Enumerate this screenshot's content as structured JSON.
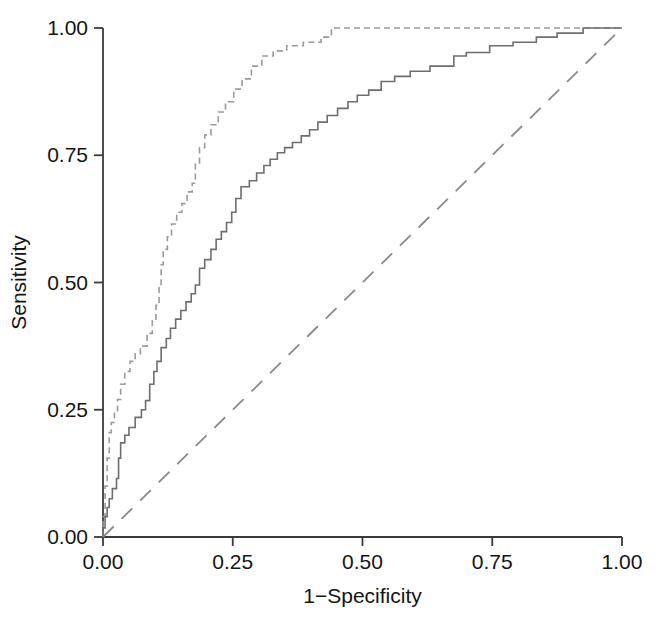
{
  "chart_data": {
    "type": "line",
    "title": "",
    "subtitle": "",
    "xlabel": "1−Specificity",
    "ylabel": "Sensitivity",
    "xlim": [
      0,
      1
    ],
    "ylim": [
      0,
      1
    ],
    "grid": false,
    "legend": "none",
    "legend_entries": [],
    "annotations": [],
    "xticks": [
      0,
      0.25,
      0.5,
      0.75,
      1
    ],
    "yticks": [
      0,
      0.25,
      0.5,
      0.75,
      1
    ],
    "xticklabels": [
      "0.00",
      "0.25",
      "0.50",
      "0.75",
      "1.00"
    ],
    "yticklabels": [
      "0.00",
      "0.25",
      "0.50",
      "0.75",
      "1.00"
    ],
    "axis_color": "#3a3a3a",
    "text_color": "#141414",
    "series": [
      {
        "name": "roc-curve-dashed",
        "style": "dashed",
        "color": "#9a9a9a",
        "linewidth": 1.6,
        "drawstyle": "steps-post",
        "points": [
          [
            0.0,
            0.0
          ],
          [
            0.0,
            0.04
          ],
          [
            0.004,
            0.04
          ],
          [
            0.004,
            0.1
          ],
          [
            0.008,
            0.1
          ],
          [
            0.008,
            0.155
          ],
          [
            0.012,
            0.155
          ],
          [
            0.012,
            0.205
          ],
          [
            0.016,
            0.205
          ],
          [
            0.016,
            0.225
          ],
          [
            0.022,
            0.225
          ],
          [
            0.022,
            0.245
          ],
          [
            0.028,
            0.245
          ],
          [
            0.028,
            0.27
          ],
          [
            0.034,
            0.27
          ],
          [
            0.034,
            0.3
          ],
          [
            0.042,
            0.3
          ],
          [
            0.042,
            0.325
          ],
          [
            0.052,
            0.325
          ],
          [
            0.052,
            0.345
          ],
          [
            0.062,
            0.345
          ],
          [
            0.062,
            0.36
          ],
          [
            0.072,
            0.36
          ],
          [
            0.072,
            0.375
          ],
          [
            0.085,
            0.375
          ],
          [
            0.085,
            0.4
          ],
          [
            0.095,
            0.4
          ],
          [
            0.095,
            0.425
          ],
          [
            0.102,
            0.425
          ],
          [
            0.102,
            0.455
          ],
          [
            0.108,
            0.455
          ],
          [
            0.108,
            0.49
          ],
          [
            0.112,
            0.49
          ],
          [
            0.112,
            0.535
          ],
          [
            0.116,
            0.535
          ],
          [
            0.116,
            0.565
          ],
          [
            0.124,
            0.565
          ],
          [
            0.124,
            0.59
          ],
          [
            0.132,
            0.59
          ],
          [
            0.132,
            0.615
          ],
          [
            0.142,
            0.615
          ],
          [
            0.142,
            0.638
          ],
          [
            0.152,
            0.638
          ],
          [
            0.152,
            0.655
          ],
          [
            0.162,
            0.655
          ],
          [
            0.162,
            0.678
          ],
          [
            0.172,
            0.678
          ],
          [
            0.172,
            0.695
          ],
          [
            0.178,
            0.695
          ],
          [
            0.178,
            0.735
          ],
          [
            0.186,
            0.735
          ],
          [
            0.186,
            0.765
          ],
          [
            0.196,
            0.765
          ],
          [
            0.196,
            0.79
          ],
          [
            0.208,
            0.79
          ],
          [
            0.208,
            0.81
          ],
          [
            0.222,
            0.81
          ],
          [
            0.222,
            0.835
          ],
          [
            0.236,
            0.835
          ],
          [
            0.236,
            0.855
          ],
          [
            0.252,
            0.855
          ],
          [
            0.252,
            0.88
          ],
          [
            0.268,
            0.88
          ],
          [
            0.268,
            0.9
          ],
          [
            0.286,
            0.9
          ],
          [
            0.286,
            0.925
          ],
          [
            0.306,
            0.925
          ],
          [
            0.306,
            0.945
          ],
          [
            0.328,
            0.945
          ],
          [
            0.328,
            0.955
          ],
          [
            0.354,
            0.955
          ],
          [
            0.354,
            0.965
          ],
          [
            0.386,
            0.965
          ],
          [
            0.386,
            0.972
          ],
          [
            0.42,
            0.972
          ],
          [
            0.42,
            0.982
          ],
          [
            0.44,
            0.982
          ],
          [
            0.44,
            1.0
          ],
          [
            1.0,
            1.0
          ]
        ]
      },
      {
        "name": "roc-curve-solid",
        "style": "solid",
        "color": "#6e6e6e",
        "linewidth": 1.6,
        "drawstyle": "steps-post",
        "points": [
          [
            0.0,
            0.0
          ],
          [
            0.0,
            0.018
          ],
          [
            0.004,
            0.018
          ],
          [
            0.004,
            0.04
          ],
          [
            0.008,
            0.04
          ],
          [
            0.008,
            0.058
          ],
          [
            0.012,
            0.058
          ],
          [
            0.012,
            0.075
          ],
          [
            0.018,
            0.075
          ],
          [
            0.018,
            0.095
          ],
          [
            0.026,
            0.095
          ],
          [
            0.026,
            0.115
          ],
          [
            0.03,
            0.115
          ],
          [
            0.03,
            0.155
          ],
          [
            0.034,
            0.155
          ],
          [
            0.034,
            0.185
          ],
          [
            0.042,
            0.185
          ],
          [
            0.042,
            0.2
          ],
          [
            0.05,
            0.2
          ],
          [
            0.05,
            0.215
          ],
          [
            0.062,
            0.215
          ],
          [
            0.062,
            0.235
          ],
          [
            0.074,
            0.235
          ],
          [
            0.074,
            0.25
          ],
          [
            0.082,
            0.25
          ],
          [
            0.082,
            0.268
          ],
          [
            0.09,
            0.268
          ],
          [
            0.09,
            0.3
          ],
          [
            0.098,
            0.3
          ],
          [
            0.098,
            0.325
          ],
          [
            0.104,
            0.325
          ],
          [
            0.104,
            0.345
          ],
          [
            0.112,
            0.345
          ],
          [
            0.112,
            0.372
          ],
          [
            0.122,
            0.372
          ],
          [
            0.122,
            0.39
          ],
          [
            0.13,
            0.39
          ],
          [
            0.13,
            0.41
          ],
          [
            0.14,
            0.41
          ],
          [
            0.14,
            0.428
          ],
          [
            0.15,
            0.428
          ],
          [
            0.15,
            0.445
          ],
          [
            0.16,
            0.445
          ],
          [
            0.16,
            0.462
          ],
          [
            0.17,
            0.462
          ],
          [
            0.17,
            0.478
          ],
          [
            0.178,
            0.478
          ],
          [
            0.178,
            0.495
          ],
          [
            0.186,
            0.495
          ],
          [
            0.186,
            0.528
          ],
          [
            0.196,
            0.528
          ],
          [
            0.196,
            0.545
          ],
          [
            0.208,
            0.545
          ],
          [
            0.208,
            0.565
          ],
          [
            0.218,
            0.565
          ],
          [
            0.218,
            0.585
          ],
          [
            0.228,
            0.585
          ],
          [
            0.228,
            0.6
          ],
          [
            0.238,
            0.6
          ],
          [
            0.238,
            0.618
          ],
          [
            0.248,
            0.618
          ],
          [
            0.248,
            0.638
          ],
          [
            0.256,
            0.638
          ],
          [
            0.256,
            0.665
          ],
          [
            0.266,
            0.665
          ],
          [
            0.266,
            0.688
          ],
          [
            0.282,
            0.688
          ],
          [
            0.282,
            0.7
          ],
          [
            0.296,
            0.7
          ],
          [
            0.296,
            0.715
          ],
          [
            0.31,
            0.715
          ],
          [
            0.31,
            0.73
          ],
          [
            0.322,
            0.73
          ],
          [
            0.322,
            0.742
          ],
          [
            0.336,
            0.742
          ],
          [
            0.336,
            0.755
          ],
          [
            0.35,
            0.755
          ],
          [
            0.35,
            0.765
          ],
          [
            0.365,
            0.765
          ],
          [
            0.365,
            0.775
          ],
          [
            0.382,
            0.775
          ],
          [
            0.382,
            0.788
          ],
          [
            0.398,
            0.788
          ],
          [
            0.398,
            0.8
          ],
          [
            0.414,
            0.8
          ],
          [
            0.414,
            0.815
          ],
          [
            0.432,
            0.815
          ],
          [
            0.432,
            0.828
          ],
          [
            0.452,
            0.828
          ],
          [
            0.452,
            0.842
          ],
          [
            0.472,
            0.842
          ],
          [
            0.472,
            0.855
          ],
          [
            0.49,
            0.855
          ],
          [
            0.49,
            0.868
          ],
          [
            0.512,
            0.868
          ],
          [
            0.512,
            0.878
          ],
          [
            0.536,
            0.878
          ],
          [
            0.536,
            0.895
          ],
          [
            0.562,
            0.895
          ],
          [
            0.562,
            0.905
          ],
          [
            0.592,
            0.905
          ],
          [
            0.592,
            0.915
          ],
          [
            0.63,
            0.915
          ],
          [
            0.63,
            0.925
          ],
          [
            0.676,
            0.925
          ],
          [
            0.676,
            0.945
          ],
          [
            0.7,
            0.945
          ],
          [
            0.7,
            0.952
          ],
          [
            0.745,
            0.952
          ],
          [
            0.745,
            0.965
          ],
          [
            0.79,
            0.965
          ],
          [
            0.79,
            0.972
          ],
          [
            0.835,
            0.972
          ],
          [
            0.835,
            0.982
          ],
          [
            0.875,
            0.982
          ],
          [
            0.875,
            0.99
          ],
          [
            0.925,
            0.99
          ],
          [
            0.925,
            1.0
          ],
          [
            1.0,
            1.0
          ]
        ]
      },
      {
        "name": "reference-diagonal",
        "style": "long-dashed",
        "color": "#8a8a8a",
        "linewidth": 1.8,
        "drawstyle": "default",
        "points": [
          [
            0,
            0
          ],
          [
            1,
            1
          ]
        ]
      }
    ]
  }
}
